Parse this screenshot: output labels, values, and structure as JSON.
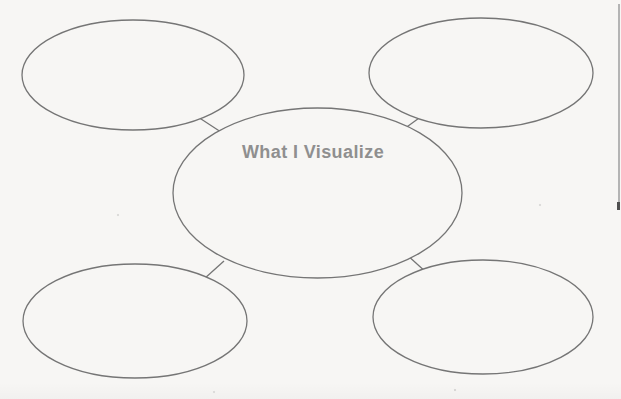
{
  "page": {
    "background_color": "#f7f6f4"
  },
  "diagram": {
    "type": "bubble-map",
    "center_label": "What I Visualize",
    "label_color": "#8f8f8f",
    "stroke_color": "#757575",
    "stroke_width": 1.3,
    "nodes": [
      {
        "id": "center",
        "cx": 317.5,
        "cy": 193,
        "rx": 144.5,
        "ry": 85,
        "label": "What I Visualize"
      },
      {
        "id": "top-left",
        "cx": 133,
        "cy": 75,
        "rx": 111,
        "ry": 55,
        "label": ""
      },
      {
        "id": "top-right",
        "cx": 481,
        "cy": 73,
        "rx": 112,
        "ry": 55,
        "label": ""
      },
      {
        "id": "bottom-left",
        "cx": 135,
        "cy": 321,
        "rx": 112,
        "ry": 57,
        "label": ""
      },
      {
        "id": "bottom-right",
        "cx": 483,
        "cy": 317,
        "rx": 110,
        "ry": 57,
        "label": ""
      }
    ],
    "connectors": [
      {
        "from": "top-left",
        "to": "center",
        "x1": 198,
        "y1": 117,
        "x2": 224,
        "y2": 134
      },
      {
        "from": "top-right",
        "to": "center",
        "x1": 426,
        "y1": 113,
        "x2": 404,
        "y2": 129
      },
      {
        "from": "bottom-left",
        "to": "center",
        "x1": 204,
        "y1": 279,
        "x2": 224,
        "y2": 261
      },
      {
        "from": "bottom-right",
        "to": "center",
        "x1": 427,
        "y1": 273,
        "x2": 406,
        "y2": 254
      }
    ]
  },
  "scan_artifacts": {
    "right_edge_line": {
      "x": 618,
      "y1": 4,
      "y2": 210,
      "width": 1.5,
      "color": "#b4b4b4"
    },
    "right_edge_tip": {
      "x": 617,
      "y1": 202,
      "y2": 210,
      "width": 3,
      "color": "#4f4f4f"
    }
  }
}
